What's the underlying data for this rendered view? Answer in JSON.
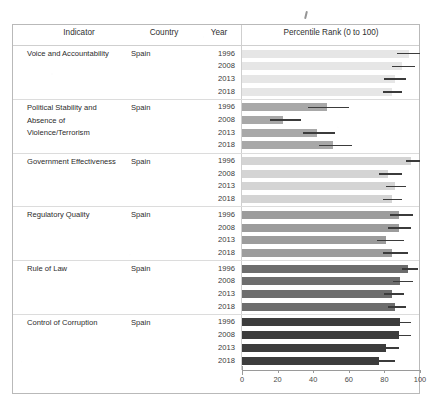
{
  "table": {
    "columns": [
      "Indicator",
      "Country",
      "Year",
      "Percentile Rank (0 to 100)"
    ],
    "header": {
      "indicator": "Indicator",
      "country": "Country",
      "year": "Year",
      "rank": "Percentile Rank (0 to 100)"
    }
  },
  "axis": {
    "ticks": [
      "0",
      "20",
      "40",
      "60",
      "80",
      "100"
    ],
    "min": 0,
    "max": 100
  },
  "colors": {
    "bar_voice": "#e6e6e6",
    "bar_political": "#a8a8a8",
    "bar_government": "#d4d4d4",
    "bar_regulatory": "#9c9c9c",
    "bar_rule": "#6d6d6d",
    "bar_control": "#3c3c3c",
    "error_bar": "#3b3b3b",
    "grid": "#cfcfcf",
    "frame": "#b9b9b9"
  },
  "chart_data": {
    "type": "bar",
    "title": "Percentile Rank (0 to 100)",
    "xlabel": "Percentile Rank (0 to 100)",
    "ylabel": "",
    "xlim": [
      0,
      100
    ],
    "grid": false,
    "legend": "none",
    "orientation": "horizontal",
    "country": "Spain",
    "years": [
      1996,
      2008,
      2013,
      2018
    ],
    "groups": [
      {
        "indicator": "Voice and Accountability",
        "country": "Spain",
        "bar_color": "#e6e6e6",
        "rows": [
          {
            "year": "1996",
            "value": 94,
            "error_low": 87,
            "error_high": 100
          },
          {
            "year": "2008",
            "value": 90,
            "error_low": 84,
            "error_high": 97
          },
          {
            "year": "2013",
            "value": 86,
            "error_low": 80,
            "error_high": 92
          },
          {
            "year": "2018",
            "value": 84,
            "error_low": 79,
            "error_high": 90
          }
        ]
      },
      {
        "indicator": "Political Stability and Absence of Violence/Terrorism",
        "country": "Spain",
        "bar_color": "#a8a8a8",
        "rows": [
          {
            "year": "1996",
            "value": 48,
            "error_low": 37,
            "error_high": 60
          },
          {
            "year": "2008",
            "value": 23,
            "error_low": 16,
            "error_high": 33
          },
          {
            "year": "2013",
            "value": 42,
            "error_low": 34,
            "error_high": 52
          },
          {
            "year": "2018",
            "value": 51,
            "error_low": 43,
            "error_high": 62
          }
        ]
      },
      {
        "indicator": "Government Effectiveness",
        "country": "Spain",
        "bar_color": "#d4d4d4",
        "rows": [
          {
            "year": "1996",
            "value": 95,
            "error_low": 92,
            "error_high": 100
          },
          {
            "year": "2008",
            "value": 82,
            "error_low": 77,
            "error_high": 90
          },
          {
            "year": "2013",
            "value": 86,
            "error_low": 81,
            "error_high": 92
          },
          {
            "year": "2018",
            "value": 84,
            "error_low": 79,
            "error_high": 90
          }
        ]
      },
      {
        "indicator": "Regulatory Quality",
        "country": "Spain",
        "bar_color": "#9c9c9c",
        "rows": [
          {
            "year": "1996",
            "value": 88,
            "error_low": 83,
            "error_high": 96
          },
          {
            "year": "2008",
            "value": 88,
            "error_low": 82,
            "error_high": 95
          },
          {
            "year": "2013",
            "value": 81,
            "error_low": 76,
            "error_high": 91
          },
          {
            "year": "2018",
            "value": 84,
            "error_low": 79,
            "error_high": 93
          }
        ]
      },
      {
        "indicator": "Rule of Law",
        "country": "Spain",
        "bar_color": "#6d6d6d",
        "rows": [
          {
            "year": "1996",
            "value": 93,
            "error_low": 90,
            "error_high": 99
          },
          {
            "year": "2008",
            "value": 89,
            "error_low": 85,
            "error_high": 96
          },
          {
            "year": "2013",
            "value": 84,
            "error_low": 80,
            "error_high": 91
          },
          {
            "year": "2018",
            "value": 86,
            "error_low": 82,
            "error_high": 92
          }
        ]
      },
      {
        "indicator": "Control of Corruption",
        "country": "Spain",
        "bar_color": "#3c3c3c",
        "rows": [
          {
            "year": "1996",
            "value": 89,
            "error_low": 86,
            "error_high": 95
          },
          {
            "year": "2008",
            "value": 88,
            "error_low": 84,
            "error_high": 95
          },
          {
            "year": "2013",
            "value": 81,
            "error_low": 77,
            "error_high": 88
          },
          {
            "year": "2018",
            "value": 77,
            "error_low": 73,
            "error_high": 86
          }
        ]
      }
    ]
  }
}
